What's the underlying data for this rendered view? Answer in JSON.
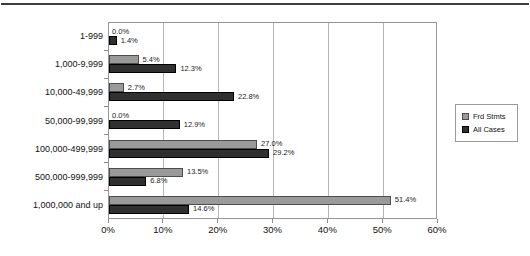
{
  "chart_data": {
    "type": "bar",
    "orientation": "horizontal",
    "title": "",
    "xlabel": "",
    "ylabel": "",
    "xlim": [
      0,
      60
    ],
    "x_tick_labels": [
      "0%",
      "10%",
      "20%",
      "30%",
      "40%",
      "50%",
      "60%"
    ],
    "x_tick_values": [
      0,
      10,
      20,
      30,
      40,
      50,
      60
    ],
    "grid": true,
    "legend_position": "right",
    "categories": [
      "1-999",
      "1,000-9,999",
      "10,000-49,999",
      "50,000-99,999",
      "100,000-499,999",
      "500,000-999,999",
      "1,000,000 and up"
    ],
    "series": [
      {
        "name": "Frd Stmts",
        "color": "#9a9a9a",
        "border_color": "#4d4d4d",
        "values": [
          0.0,
          5.4,
          2.7,
          0.0,
          27.0,
          13.5,
          51.4
        ]
      },
      {
        "name": "All Cases",
        "color": "#303030",
        "border_color": "#000000",
        "values": [
          1.4,
          12.3,
          22.8,
          12.9,
          29.2,
          6.8,
          14.6
        ]
      }
    ],
    "value_label_suffix": "%",
    "value_label_decimals": 1
  }
}
